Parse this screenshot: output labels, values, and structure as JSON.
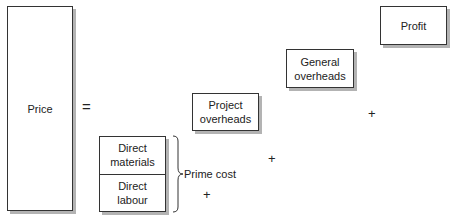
{
  "diagram": {
    "title": "",
    "price": {
      "label": "Price"
    },
    "equals": "=",
    "prime_cost_components": [
      {
        "label": "Direct\nmaterials"
      },
      {
        "label": "Direct\nlabour"
      }
    ],
    "prime_cost_label": "Prime cost",
    "project_overheads": {
      "label": "Project\noverheads"
    },
    "general_overheads": {
      "label": "General\noverheads"
    },
    "profit": {
      "label": "Profit"
    },
    "plus_signs": [
      "+",
      "+",
      "+"
    ],
    "colors": {
      "border": "#333333",
      "shadow": "#b3b3b3",
      "text": "#222222",
      "background": "#ffffff"
    }
  }
}
